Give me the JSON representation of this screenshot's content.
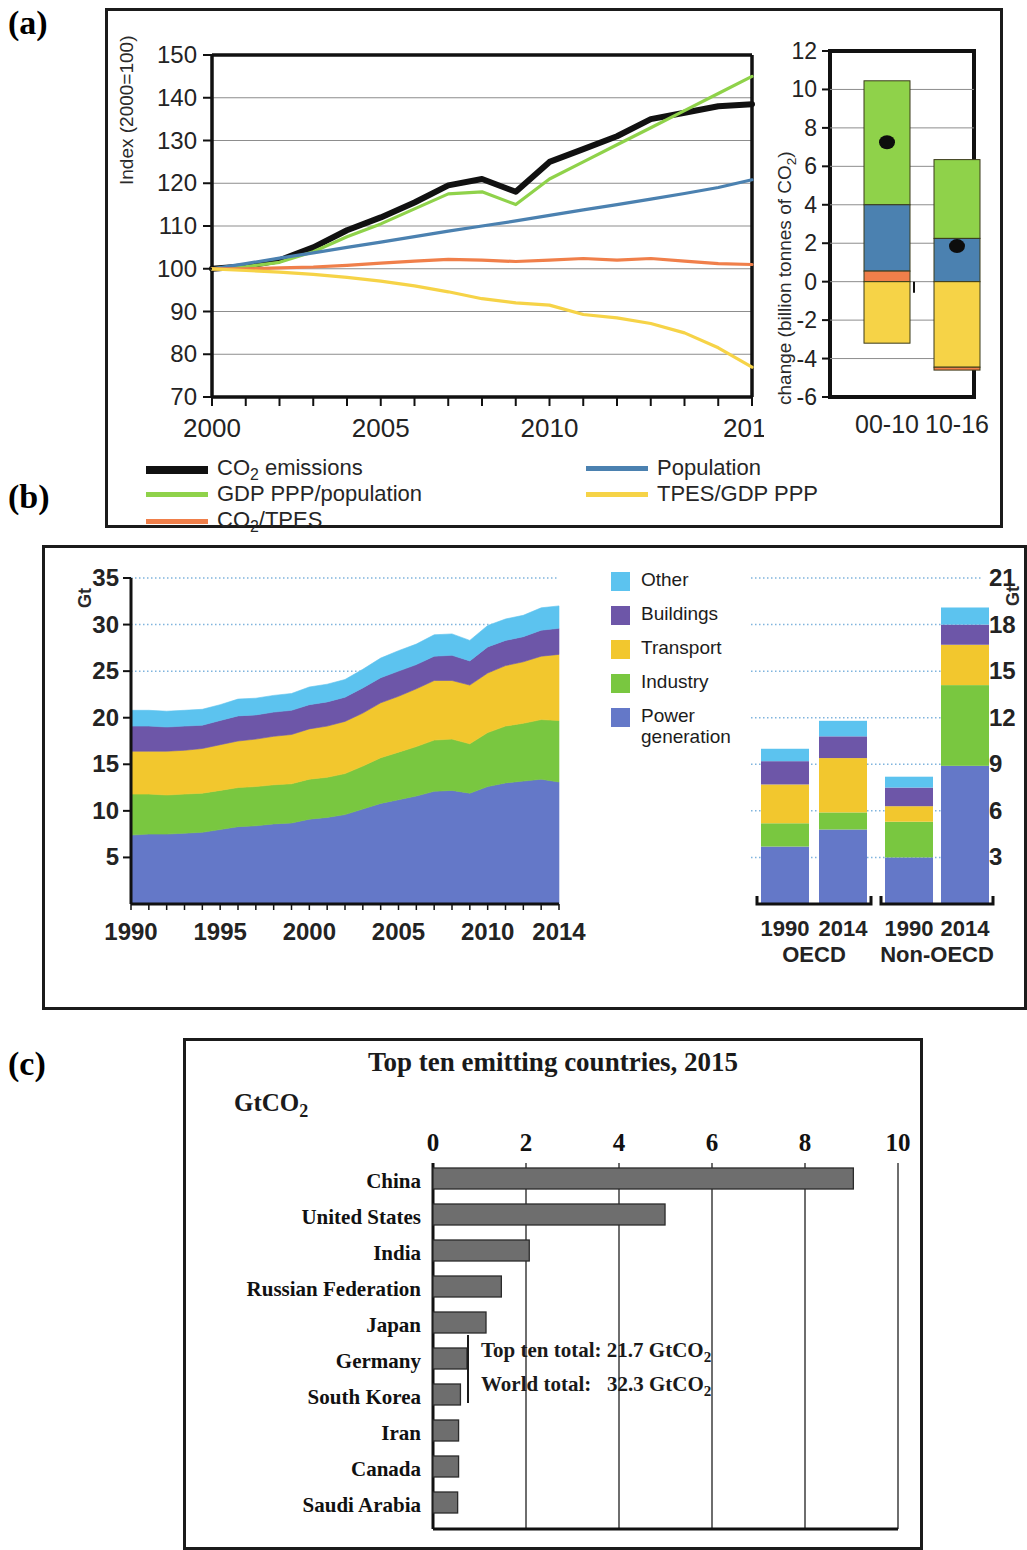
{
  "figure": {
    "panel_labels": {
      "a": "(a)",
      "b": "(b)",
      "c": "(c)"
    }
  },
  "panel_a": {
    "line_chart": {
      "ylabel": "Index (2000=100)",
      "xticks": [
        "2000",
        "2005",
        "2010",
        "2016"
      ],
      "yticks": [
        "150",
        "140",
        "130",
        "120",
        "110",
        "100",
        "90",
        "80",
        "70"
      ]
    },
    "bar_chart": {
      "ylabel": "change (billion tonnes of CO₂)",
      "xticks": [
        "00-10",
        "10-16"
      ],
      "yticks": [
        "12",
        "10",
        "8",
        "6",
        "4",
        "2",
        "0",
        "-2",
        "-4",
        "-6"
      ]
    },
    "legend": [
      {
        "label": "CO₂ emissions",
        "color": "#111111"
      },
      {
        "label": "Population",
        "color": "#4b81b0"
      },
      {
        "label": "GDP PPP/population",
        "color": "#8fd24a"
      },
      {
        "label": "TPES/GDP PPP",
        "color": "#f6d347"
      },
      {
        "label": "CO₂/TPES",
        "color": "#f07f4a"
      }
    ]
  },
  "panel_b": {
    "unit_left": "Gt",
    "unit_right": "Gt",
    "area_yticks": [
      "35",
      "30",
      "25",
      "20",
      "15",
      "10",
      "5"
    ],
    "area_xticks": [
      "1990",
      "1995",
      "2000",
      "2005",
      "2010",
      "2014"
    ],
    "bars_yticks": [
      "21",
      "18",
      "15",
      "12",
      "9",
      "6",
      "3"
    ],
    "bar_group_labels": [
      "OECD",
      "Non-OECD"
    ],
    "bar_year_labels": [
      "1990",
      "2014",
      "1990",
      "2014"
    ],
    "legend": [
      {
        "label": "Other",
        "color": "#5cc3ef"
      },
      {
        "label": "Buildings",
        "color": "#6d56a8"
      },
      {
        "label": "Transport",
        "color": "#f2c72e"
      },
      {
        "label": "Industry",
        "color": "#79c740"
      },
      {
        "label": "Power generation",
        "color": "#6478c8"
      }
    ]
  },
  "panel_c": {
    "title": "Top ten emitting countries, 2015",
    "unit": "GtCO₂",
    "xticks": [
      "0",
      "2",
      "4",
      "6",
      "8",
      "10"
    ],
    "totals": {
      "top_ten_label": "Top ten total:",
      "top_ten_value": "21.7 GtCO₂",
      "world_label": "World total:",
      "world_value": "32.3 GtCO₂"
    },
    "bar_color": "#6e6e6e"
  },
  "chart_data": [
    {
      "id": "panel_a_lines",
      "type": "line",
      "title": "",
      "xlabel": "",
      "ylabel": "Index (2000=100)",
      "xlim": [
        2000,
        2016
      ],
      "ylim": [
        70,
        150
      ],
      "grid": true,
      "legend_position": "below",
      "x": [
        2000,
        2001,
        2002,
        2003,
        2004,
        2005,
        2006,
        2007,
        2008,
        2009,
        2010,
        2011,
        2012,
        2013,
        2014,
        2015,
        2016
      ],
      "series": [
        {
          "name": "CO₂ emissions",
          "color": "#111111",
          "values": [
            100,
            100.6,
            102,
            105,
            109,
            112,
            115.5,
            119.5,
            121,
            118,
            125,
            128,
            131,
            135,
            136.5,
            138,
            138.5
          ]
        },
        {
          "name": "GDP PPP/population",
          "color": "#8fd24a",
          "values": [
            100,
            100.5,
            101.5,
            104,
            107.5,
            110.5,
            114,
            117.5,
            118,
            115,
            121,
            125,
            129,
            133,
            137,
            141,
            145
          ]
        },
        {
          "name": "Population",
          "color": "#4b81b0",
          "values": [
            100,
            101.2,
            102.5,
            103.7,
            105,
            106.2,
            107.5,
            108.8,
            110,
            111.2,
            112.5,
            113.8,
            115,
            116.3,
            117.6,
            119,
            120.8
          ]
        },
        {
          "name": "CO₂/TPES",
          "color": "#f07f4a",
          "values": [
            100,
            100,
            100.2,
            100.4,
            100.8,
            101.3,
            101.8,
            102.2,
            102,
            101.7,
            102,
            102.4,
            102,
            102.4,
            101.8,
            101.2,
            101
          ]
        },
        {
          "name": "TPES/GDP PPP",
          "color": "#f6d347",
          "values": [
            100,
            99.6,
            99.2,
            98.7,
            98,
            97.1,
            96,
            94.6,
            93,
            92,
            91.5,
            89.3,
            88.5,
            87.2,
            85,
            81.5,
            77
          ]
        }
      ]
    },
    {
      "id": "panel_a_decomposition",
      "type": "bar",
      "subtype": "stacked-with-net-marker",
      "title": "",
      "xlabel": "",
      "ylabel": "change (billion tonnes of CO₂)",
      "categories": [
        "00-10",
        "10-16"
      ],
      "ylim": [
        -6,
        12
      ],
      "grid": true,
      "series": [
        {
          "name": "GDP PPP/population",
          "color": "#8fd24a",
          "values": [
            6.45,
            4.1
          ]
        },
        {
          "name": "Population",
          "color": "#4b81b0",
          "values": [
            3.4,
            2.25
          ]
        },
        {
          "name": "CO₂/TPES",
          "color": "#f07f4a",
          "values": [
            0.55,
            -0.15
          ]
        },
        {
          "name": "TPES/GDP PPP",
          "color": "#f6d347",
          "values": [
            -3.2,
            -4.45
          ]
        }
      ],
      "segment_bounds": {
        "00-10": [
          {
            "name": "GDP PPP/population",
            "from": 4.0,
            "to": 10.45
          },
          {
            "name": "Population",
            "from": 0.55,
            "to": 4.0
          },
          {
            "name": "CO₂/TPES",
            "from": 0.0,
            "to": 0.55
          },
          {
            "name": "TPES/GDP PPP",
            "from": -3.2,
            "to": 0.0
          }
        ],
        "10-16": [
          {
            "name": "GDP PPP/population",
            "from": 2.25,
            "to": 6.35
          },
          {
            "name": "Population",
            "from": 0.0,
            "to": 2.25
          },
          {
            "name": "TPES/GDP PPP",
            "from": -4.45,
            "to": 0.0
          },
          {
            "name": "CO₂/TPES",
            "from": -4.6,
            "to": -4.45
          }
        ]
      },
      "net_change_markers": {
        "00-10": 7.25,
        "10-16": 1.85
      }
    },
    {
      "id": "panel_b_area",
      "type": "area",
      "subtype": "stacked",
      "title": "",
      "xlabel": "",
      "ylabel": "Gt",
      "xlim": [
        1990,
        2014
      ],
      "ylim": [
        0,
        35
      ],
      "grid": true,
      "legend_position": "right",
      "x": [
        1990,
        1991,
        1992,
        1993,
        1994,
        1995,
        1996,
        1997,
        1998,
        1999,
        2000,
        2001,
        2002,
        2003,
        2004,
        2005,
        2006,
        2007,
        2008,
        2009,
        2010,
        2011,
        2012,
        2013,
        2014
      ],
      "series": [
        {
          "name": "Power generation",
          "color": "#6478c8",
          "values": [
            7.4,
            7.5,
            7.5,
            7.6,
            7.7,
            8.0,
            8.3,
            8.4,
            8.6,
            8.7,
            9.1,
            9.3,
            9.6,
            10.2,
            10.8,
            11.2,
            11.6,
            12.1,
            12.2,
            11.9,
            12.6,
            13.0,
            13.2,
            13.4,
            13.1
          ]
        },
        {
          "name": "Industry",
          "color": "#79c740",
          "values": [
            4.4,
            4.3,
            4.2,
            4.2,
            4.2,
            4.2,
            4.2,
            4.2,
            4.2,
            4.2,
            4.3,
            4.3,
            4.4,
            4.6,
            4.9,
            5.1,
            5.3,
            5.5,
            5.5,
            5.3,
            5.8,
            6.1,
            6.2,
            6.4,
            6.6
          ]
        },
        {
          "name": "Transport",
          "color": "#f2c72e",
          "values": [
            4.6,
            4.6,
            4.7,
            4.7,
            4.8,
            4.9,
            5.0,
            5.1,
            5.2,
            5.3,
            5.4,
            5.5,
            5.6,
            5.7,
            5.9,
            6.0,
            6.2,
            6.4,
            6.3,
            6.3,
            6.4,
            6.5,
            6.6,
            6.8,
            7.1
          ]
        },
        {
          "name": "Buildings",
          "color": "#6d56a8",
          "values": [
            2.7,
            2.7,
            2.6,
            2.6,
            2.5,
            2.6,
            2.7,
            2.6,
            2.6,
            2.6,
            2.6,
            2.6,
            2.6,
            2.7,
            2.7,
            2.7,
            2.6,
            2.6,
            2.7,
            2.6,
            2.8,
            2.7,
            2.7,
            2.8,
            2.8
          ]
        },
        {
          "name": "Other",
          "color": "#5cc3ef",
          "values": [
            1.7,
            1.7,
            1.7,
            1.7,
            1.7,
            1.7,
            1.8,
            1.8,
            1.8,
            1.8,
            1.9,
            1.9,
            1.9,
            2.0,
            2.1,
            2.2,
            2.2,
            2.3,
            2.3,
            2.2,
            2.3,
            2.3,
            2.3,
            2.4,
            2.4
          ]
        }
      ]
    },
    {
      "id": "panel_b_bars",
      "type": "bar",
      "subtype": "stacked",
      "title": "",
      "xlabel": "",
      "ylabel": "Gt",
      "categories": [
        "1990 OECD",
        "2014 OECD",
        "1990 Non-OECD",
        "2014 Non-OECD"
      ],
      "groups": [
        "OECD",
        "Non-OECD"
      ],
      "ylim": [
        0,
        21
      ],
      "grid": true,
      "series": [
        {
          "name": "Power generation",
          "color": "#6478c8",
          "values": [
            3.7,
            4.8,
            3.0,
            8.9
          ]
        },
        {
          "name": "Industry",
          "color": "#79c740",
          "values": [
            1.5,
            1.1,
            2.3,
            5.2
          ]
        },
        {
          "name": "Transport",
          "color": "#f2c72e",
          "values": [
            2.5,
            3.5,
            1.0,
            2.6
          ]
        },
        {
          "name": "Buildings",
          "color": "#6d56a8",
          "values": [
            1.5,
            1.4,
            1.2,
            1.3
          ]
        },
        {
          "name": "Other",
          "color": "#5cc3ef",
          "values": [
            0.8,
            1.0,
            0.7,
            1.1
          ]
        }
      ],
      "totals": [
        10.0,
        11.8,
        8.2,
        19.1
      ]
    },
    {
      "id": "panel_c_top_ten",
      "type": "bar",
      "subtype": "horizontal",
      "title": "Top ten emitting countries, 2015",
      "xlabel": "GtCO₂",
      "ylabel": "",
      "xlim": [
        0,
        10
      ],
      "grid": true,
      "categories": [
        "China",
        "United States",
        "India",
        "Russian Federation",
        "Japan",
        "Germany",
        "South Korea",
        "Iran",
        "Canada",
        "Saudi Arabia"
      ],
      "values": [
        9.04,
        4.99,
        2.07,
        1.47,
        1.14,
        0.73,
        0.59,
        0.55,
        0.55,
        0.53
      ],
      "annotations": [
        "Top ten total:  21.7 GtCO₂",
        "World total:  32.3 GtCO₂"
      ]
    }
  ]
}
